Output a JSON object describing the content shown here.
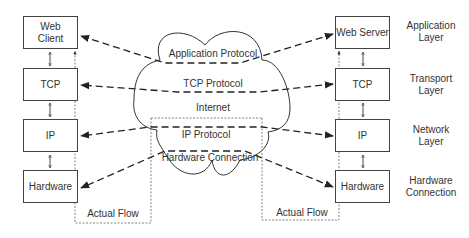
{
  "client_stack": [
    {
      "id": "web-client",
      "label": "Web\nClient"
    },
    {
      "id": "tcp",
      "label": "TCP"
    },
    {
      "id": "ip",
      "label": "IP"
    },
    {
      "id": "hardware",
      "label": "Hardware"
    }
  ],
  "server_stack": [
    {
      "id": "web-server",
      "label": "Web Server"
    },
    {
      "id": "tcp",
      "label": "TCP"
    },
    {
      "id": "ip",
      "label": "IP"
    },
    {
      "id": "hardware",
      "label": "Hardware"
    }
  ],
  "layers": [
    {
      "label": "Application\nLayer"
    },
    {
      "label": "Transport\nLayer"
    },
    {
      "label": "Network\nLayer"
    },
    {
      "label": "Hardware\nConnection"
    }
  ],
  "cloud": {
    "protocols": [
      {
        "label": "Application Protocol"
      },
      {
        "label": "TCP Protocol"
      },
      {
        "label": "IP Protocol"
      },
      {
        "label": "Hardware Connection"
      }
    ],
    "internet_label": "Internet"
  },
  "flow": {
    "left_label": "Actual Flow",
    "right_label": "Actual Flow"
  },
  "colors": {
    "stroke": "#333333",
    "text": "#333333",
    "dotted": "#555555"
  }
}
